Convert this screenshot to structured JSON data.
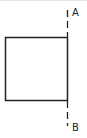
{
  "diagram": {
    "shape": "square",
    "line": {
      "style": "dashed",
      "orientation": "vertical"
    },
    "labels": {
      "top": "A",
      "bottom": "B"
    },
    "colors": {
      "stroke": "#222222",
      "background": "#ffffff"
    }
  }
}
